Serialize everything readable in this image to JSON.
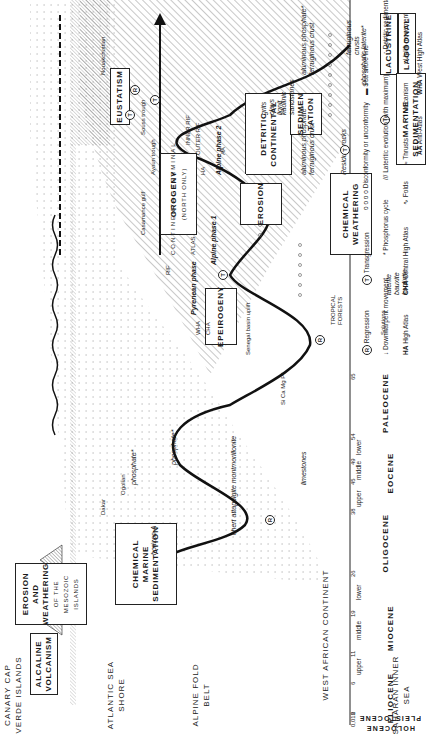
{
  "columns": [
    {
      "id": "canary",
      "label": "CANARY CAP VERDE ISLANDS"
    },
    {
      "id": "atlantic",
      "label": "ATLANTIC SEA SHORE"
    },
    {
      "id": "alpine",
      "label": "ALPINE FOLD BELT"
    },
    {
      "id": "westafrica",
      "label": "WEST AFRICAN CONTINENT"
    },
    {
      "id": "saharan",
      "label": "SAHARAN INNER SEA"
    }
  ],
  "timescale": {
    "epochs": [
      {
        "name": "HOLOCENE"
      },
      {
        "name": "PLEISTOCENE"
      },
      {
        "name": "PLIOCENE"
      },
      {
        "name": "MIOCENE",
        "subdivisions": [
          "upper",
          "middle",
          "lower"
        ]
      },
      {
        "name": "OLIGOCENE"
      },
      {
        "name": "EOCENE",
        "subdivisions": [
          "upper",
          "middle",
          "lower"
        ]
      },
      {
        "name": "PALEOCENE"
      }
    ],
    "ticks_ma": [
      "0,018",
      "2",
      "6",
      "11",
      "19",
      "26",
      "38",
      "45",
      "49",
      "54",
      "65"
    ]
  },
  "boxes": {
    "alcaline": "ALCALINE VOLCANISM",
    "erosion_weathering": [
      "EROSION",
      "AND",
      "WEATHERING"
    ],
    "erosion_weathering_sub": [
      "of the",
      "Mesozoic",
      "islands"
    ],
    "eustatism": "EUSTATISM",
    "orogeny": "OROGENY",
    "orogeny_sub": "(north only)",
    "epeirogeny": "EPEIROGENY",
    "chem_marine": [
      "CHEMICAL",
      "MARINE",
      "SEDIMENTATION"
    ],
    "detritic": [
      "DETRITIC",
      "CONTINENTAL"
    ],
    "sedimentation": [
      "SEDIMEN",
      "TATION"
    ],
    "erosion": "EROSION",
    "chem_weathering": [
      "CHEMICAL",
      "WEATHERING"
    ],
    "lacustrine": "LACUSTRINE",
    "lagoonal": "LAGOONAL",
    "marine_sed": [
      "MARINE",
      "SEDIMENTATION"
    ]
  },
  "annotations": {
    "nouakchottian": "Nouakchottian",
    "ogolian": "Ogolian",
    "dakar": "Dakar",
    "souss_trough": "Souss trough",
    "ayoun_trough": "Ayoun trough",
    "casamance_gulf": "Casamance gulf",
    "phosphate": "phosphate*",
    "dakar_casamance": [
      "Dakar",
      "and Casamance",
      "gulfs"
    ],
    "horizon_a": "horizon A",
    "chert": "chert attapulgite montmorillonite",
    "limestones": "limestones",
    "senegal_uplift": "Senegal basin uplift",
    "si_ca_mg": "Si Ca Mg P*",
    "inner_rif": "INNER RIF",
    "outer_rif": "OUTER RIF",
    "rif": "RIF",
    "atlas": "ATLAS",
    "wha": "WHA",
    "cha": "CHA",
    "ha": "HA",
    "aa": "AA",
    "alpine_phase_2": "Alpine phase 2",
    "alpine_phase_1": "Alpine phase 1",
    "pyrenean_phase": "Pyrenean phase",
    "continental_terminal": "CONTINENTAL   TERMINAL",
    "residual_rocks": "Residual rocks",
    "solutions": "Solutions",
    "tropical_forests": [
      "TROPICAL",
      "FORESTS"
    ],
    "laterite": [
      "laterite",
      "bauxite",
      "kaolinite"
    ],
    "grits": [
      "grits",
      "clays",
      "lignit"
    ],
    "kaolinic": [
      "kaolinic",
      "sandstones"
    ],
    "alum_phos_1": [
      "aluminous phosphate*",
      "ferruginous crust"
    ],
    "alum_phos_2": [
      "aluminous phosphate*",
      "ferruginous crust"
    ],
    "ferruginous_crusts": [
      "ferruginous",
      "crusts"
    ],
    "phosphatic_laterite": "phosphatic laterite*"
  },
  "legend": [
    {
      "symbol": "R",
      "label": "Regression"
    },
    {
      "symbol": "T",
      "label": "Transgression"
    },
    {
      "symbol": "oooo",
      "label": "Disconformity or unconformity"
    },
    {
      "symbol": "line",
      "label": "Sea shore line"
    },
    {
      "symbol": "folds",
      "label": "Folds"
    },
    {
      "symbol": "thrusts",
      "label": "Thrusts"
    },
    {
      "symbol": "volcano",
      "label": "Volcanism"
    },
    {
      "symbol": "up-arrow",
      "label": "Uplift movement"
    },
    {
      "symbol": "down-arrow",
      "label": "Downwarpent movement"
    },
    {
      "symbol": "*",
      "label": "Phosphorus cycle"
    },
    {
      "symbol": "hatch",
      "label": "Lateritic evolution (with maximum)"
    },
    {
      "symbol": "dots",
      "label": "Detritic sedimentation"
    },
    {
      "symbol": "AA",
      "label": "Anti-Atlas"
    },
    {
      "symbol": "WHA",
      "label": "West High Atlas"
    },
    {
      "symbol": "HA",
      "label": "High Atlas"
    },
    {
      "symbol": "CHA",
      "label": "Central High Atlas"
    }
  ]
}
